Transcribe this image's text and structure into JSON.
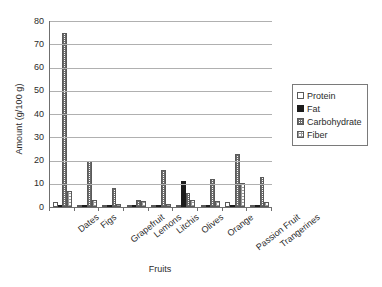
{
  "chart_data": {
    "type": "bar",
    "title": "",
    "xlabel": "Fruits",
    "ylabel": "Amount (g/100 g)",
    "ylim": [
      0,
      80
    ],
    "ytick_step": 10,
    "yticks": [
      0,
      10,
      20,
      30,
      40,
      50,
      60,
      70,
      80
    ],
    "ytick_labels": [
      "0",
      "10",
      "20",
      "30",
      "40",
      "50",
      "60",
      "70",
      "80"
    ],
    "grid": true,
    "grid_axis": "y",
    "legend_position": "right",
    "categories": [
      "Dates",
      "Figs",
      "Grapefruit",
      "Lemons",
      "Litchis",
      "Olives",
      "Orange",
      "Passion Fruit",
      "Trangerines"
    ],
    "series": [
      {
        "name": "Protein",
        "pattern": "empty",
        "values": [
          2.0,
          1.0,
          0.8,
          1.0,
          0.8,
          1.0,
          1.0,
          2.2,
          0.8
        ]
      },
      {
        "name": "Fat",
        "pattern": "solid-black",
        "values": [
          0.5,
          0.3,
          0.1,
          0.3,
          0.4,
          11.0,
          0.2,
          0.7,
          0.3
        ]
      },
      {
        "name": "Carbohydrate",
        "pattern": "dense-crosshatch",
        "values": [
          75.0,
          20.0,
          8.0,
          3.0,
          16.0,
          6.0,
          12.0,
          23.0,
          13.0
        ]
      },
      {
        "name": "Fiber",
        "pattern": "light-dotted",
        "values": [
          7.0,
          3.0,
          1.5,
          2.8,
          1.3,
          3.2,
          2.4,
          10.4,
          2.3
        ]
      }
    ]
  },
  "colors": {
    "axis": "#6f6f6f",
    "gridline": "#b0b0b0",
    "bar_outline": "#5a5a5a",
    "fat_fill": "#1c1c1c",
    "background": "#ffffff"
  }
}
